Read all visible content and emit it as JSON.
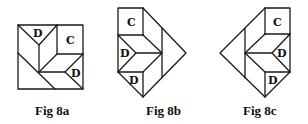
{
  "figures": [
    {
      "id": "8a",
      "caption": "Fig 8a",
      "labels": [
        {
          "text": "D",
          "x": 38,
          "y": 37
        },
        {
          "text": "C",
          "x": 70,
          "y": 44
        },
        {
          "text": "D",
          "x": 76,
          "y": 76
        }
      ]
    },
    {
      "id": "8b",
      "caption": "Fig 8b",
      "labels": [
        {
          "text": "C",
          "x": 131,
          "y": 25
        },
        {
          "text": "D",
          "x": 125,
          "y": 56
        },
        {
          "text": "D",
          "x": 134,
          "y": 83
        }
      ]
    },
    {
      "id": "8c",
      "caption": "Fig 8c",
      "labels": [
        {
          "text": "C",
          "x": 277,
          "y": 25
        },
        {
          "text": "D",
          "x": 282,
          "y": 56
        },
        {
          "text": "D",
          "x": 273,
          "y": 83
        }
      ]
    }
  ]
}
